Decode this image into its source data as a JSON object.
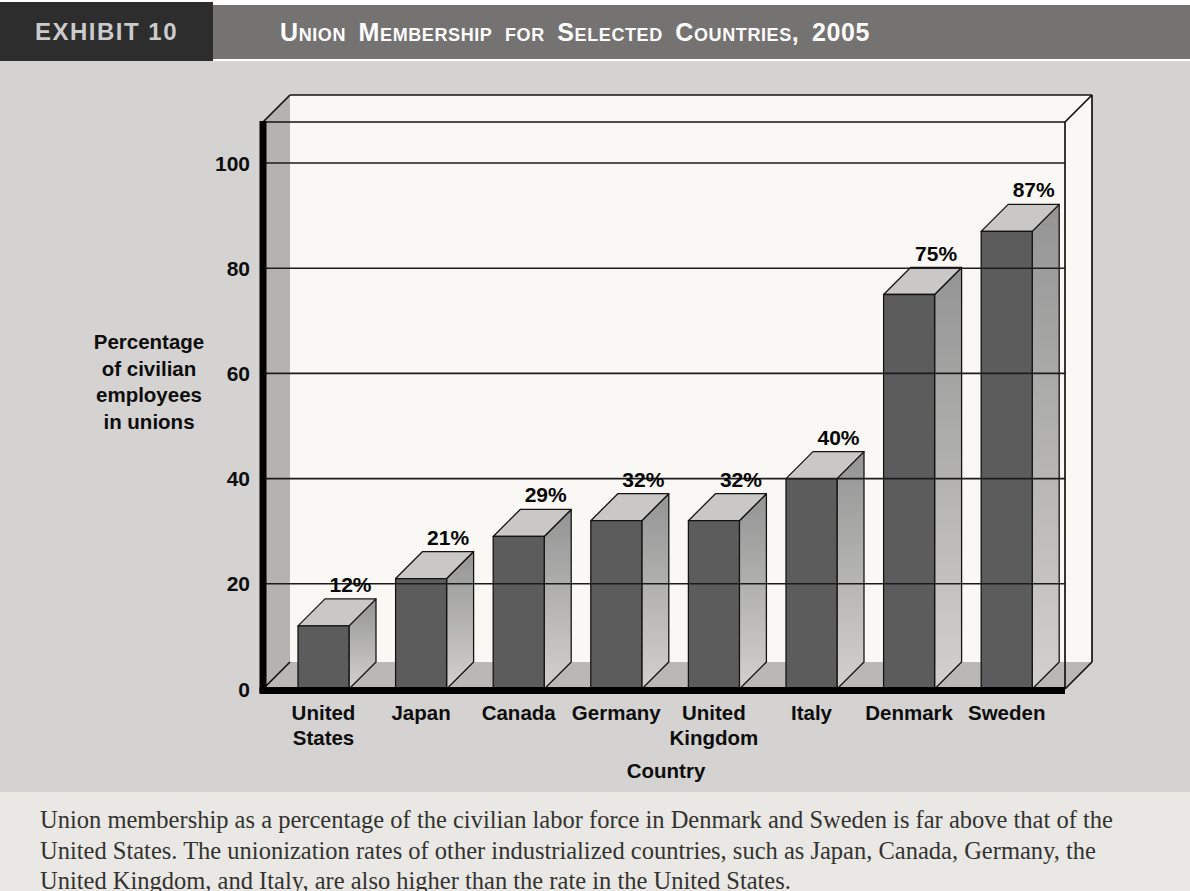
{
  "header": {
    "exhibit_label": "EXHIBIT 10",
    "title": "Union Membership for Selected Countries, 2005"
  },
  "chart_data": {
    "type": "bar",
    "style": "3d-bar",
    "title": "Union Membership for Selected Countries, 2005",
    "xlabel": "Country",
    "ylabel": "Percentage of civilian employees in unions",
    "ylabel_lines": [
      "Percentage",
      "of civilian",
      "employees",
      "in unions"
    ],
    "categories": [
      "United States",
      "Japan",
      "Canada",
      "Germany",
      "United Kingdom",
      "Italy",
      "Denmark",
      "Sweden"
    ],
    "category_lines": [
      [
        "United",
        "States"
      ],
      [
        "Japan"
      ],
      [
        "Canada"
      ],
      [
        "Germany"
      ],
      [
        "United",
        "Kingdom"
      ],
      [
        "Italy"
      ],
      [
        "Denmark"
      ],
      [
        "Sweden"
      ]
    ],
    "values": [
      12,
      21,
      29,
      32,
      32,
      40,
      75,
      87
    ],
    "value_labels": [
      "12%",
      "21%",
      "29%",
      "32%",
      "32%",
      "40%",
      "75%",
      "87%"
    ],
    "yticks": [
      0,
      20,
      40,
      60,
      80,
      100
    ],
    "ylim": [
      0,
      100
    ],
    "grid": true,
    "legend": "none"
  },
  "caption": {
    "text": "Union membership as a percentage of the civilian labor force in Denmark and Sweden is far above that of the United States. The unionization rates of other industrialized countries, such as Japan, Canada, Germany, the United Kingdom, and Italy, are also higher than the rate in the United States.",
    "lines": [
      "Union membership as a percentage of the civilian labor force in Denmark and Sweden is far above that of the",
      "United States. The unionization rates of other industrialized countries, such as Japan, Canada, Germany, the",
      "United Kingdom, and Italy, are also higher than the rate in the United States."
    ]
  },
  "colors": {
    "header_bar": "#757371",
    "exhibit_bg": "#2d2d2d",
    "exhibit_text": "#cbcbcb",
    "title_text": "#fdfdfd",
    "figure_bg": "#d4d3d1",
    "plot_bg": "#faf8f5",
    "left_wall": "#b4b3b1",
    "floor": "#bab8b6",
    "bar_front": "#5c5c5c",
    "bar_top": "#c9c8c6",
    "bar_side_top": "#949494",
    "bar_side_bottom": "#d2d1cf",
    "grid_line": "#1c1c1c",
    "edge_line": "#141414",
    "axis_line": "#000000",
    "caption_bg": "#e9e8e4",
    "caption_text": "#33322f"
  }
}
